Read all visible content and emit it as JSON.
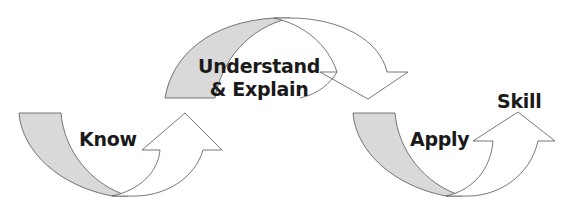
{
  "diagram": {
    "type": "process-flow",
    "colors": {
      "shade": "#d9d9d9",
      "stroke": "#555555",
      "text": "#1a1a1a",
      "background": "#ffffff"
    },
    "stages": [
      {
        "id": "know",
        "label": "Know"
      },
      {
        "id": "understand",
        "label_line1": "Understand",
        "label_line2": "& Explain"
      },
      {
        "id": "apply",
        "label": "Apply"
      }
    ],
    "outcome": {
      "label": "Skill"
    }
  }
}
